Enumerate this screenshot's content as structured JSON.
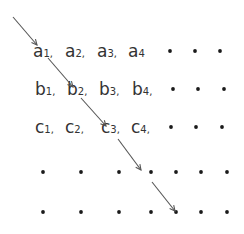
{
  "diagram": {
    "rows": [
      {
        "name": "a",
        "terms": [
          {
            "letter": "a",
            "index": "1",
            "sep": ","
          },
          {
            "letter": "a",
            "index": "2",
            "sep": ","
          },
          {
            "letter": "a",
            "index": "3",
            "sep": ","
          },
          {
            "letter": "a",
            "index": "4",
            "sep": ""
          }
        ],
        "trailing_dots": 3
      },
      {
        "name": "b",
        "terms": [
          {
            "letter": "b",
            "index": "1",
            "sep": ","
          },
          {
            "letter": "b",
            "index": "2",
            "sep": ","
          },
          {
            "letter": "b",
            "index": "3",
            "sep": ","
          },
          {
            "letter": "b",
            "index": "4",
            "sep": ","
          }
        ],
        "trailing_dots": 3
      },
      {
        "name": "c",
        "terms": [
          {
            "letter": "c",
            "index": "1",
            "sep": ","
          },
          {
            "letter": "c",
            "index": "2",
            "sep": ","
          },
          {
            "letter": "c",
            "index": "3",
            "sep": ","
          },
          {
            "letter": "c",
            "index": "4",
            "sep": ","
          }
        ],
        "trailing_dots": 3
      },
      {
        "name": "row-4",
        "terms": [],
        "trailing_dots": 7
      },
      {
        "name": "row-5",
        "terms": [],
        "trailing_dots": 7
      }
    ],
    "diagonal_path": [
      "start",
      "a1",
      "b2",
      "c3",
      "row4-col5",
      "row5-col5"
    ],
    "colors": {
      "text": "#333333",
      "dot": "#1a1a1a",
      "arrow": "#555555"
    }
  }
}
